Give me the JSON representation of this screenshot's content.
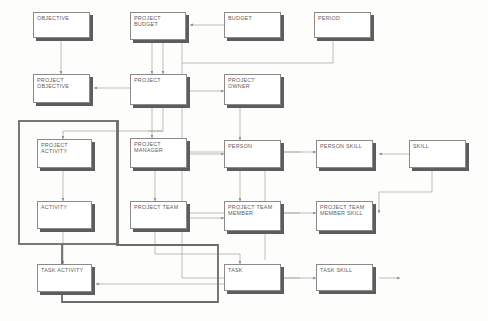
{
  "diagram": {
    "type": "entity-relationship-diagram",
    "background_color": "#fdfdfb",
    "entity_fill": "#ffffff",
    "entity_border": "#8a8a8a",
    "entity_shadow": "#5d5d5d",
    "label_color": "#5e5e5e",
    "connector_color": "#9a9a9a",
    "group_border_color": "#6b6b6b"
  },
  "entities": [
    {
      "id": "objective",
      "label": "OBJECTIVE",
      "x": 33,
      "y": 12,
      "w": 57,
      "h": 26
    },
    {
      "id": "project-budget",
      "label": "PROJECT\nBUDGET",
      "x": 130,
      "y": 12,
      "w": 56,
      "h": 28
    },
    {
      "id": "budget",
      "label": "BUDGET",
      "x": 224,
      "y": 12,
      "w": 57,
      "h": 26
    },
    {
      "id": "period",
      "label": "PERIOD",
      "x": 314,
      "y": 12,
      "w": 57,
      "h": 26
    },
    {
      "id": "project-objective",
      "label": "PROJECT\nOBJECTIVE",
      "x": 33,
      "y": 74,
      "w": 57,
      "h": 29
    },
    {
      "id": "project",
      "label": "PROJECT",
      "x": 130,
      "y": 74,
      "w": 57,
      "h": 31
    },
    {
      "id": "project-owner",
      "label": "PROJECT\nOWNER",
      "x": 224,
      "y": 74,
      "w": 57,
      "h": 31
    },
    {
      "id": "project-activity",
      "label": "PROJECT\nACTIVITY",
      "x": 37,
      "y": 139,
      "w": 55,
      "h": 29
    },
    {
      "id": "project-manager",
      "label": "PROJECT\nMANAGER",
      "x": 130,
      "y": 138,
      "w": 57,
      "h": 30
    },
    {
      "id": "person",
      "label": "PERSON",
      "x": 224,
      "y": 140,
      "w": 57,
      "h": 28
    },
    {
      "id": "person-skill",
      "label": "PERSON SKILL",
      "x": 316,
      "y": 140,
      "w": 57,
      "h": 28
    },
    {
      "id": "skill",
      "label": "SKILL",
      "x": 409,
      "y": 140,
      "w": 57,
      "h": 28
    },
    {
      "id": "activity",
      "label": "ACTIVITY",
      "x": 37,
      "y": 201,
      "w": 55,
      "h": 28
    },
    {
      "id": "project-team",
      "label": "PROJECT TEAM",
      "x": 130,
      "y": 201,
      "w": 57,
      "h": 28
    },
    {
      "id": "project-team-member",
      "label": "PROJECT TEAM\nMEMBER",
      "x": 224,
      "y": 201,
      "w": 57,
      "h": 30
    },
    {
      "id": "project-team-member-skill",
      "label": "PROJECT TEAM\nMEMBER SKILL",
      "x": 316,
      "y": 201,
      "w": 57,
      "h": 30
    },
    {
      "id": "task-activity",
      "label": "TASK ACTIVITY",
      "x": 37,
      "y": 264,
      "w": 55,
      "h": 28
    },
    {
      "id": "task",
      "label": "TASK",
      "x": 224,
      "y": 264,
      "w": 57,
      "h": 27
    },
    {
      "id": "task-skill",
      "label": "TASK SKILL",
      "x": 316,
      "y": 264,
      "w": 57,
      "h": 27
    }
  ],
  "groups": [
    {
      "id": "activity-group",
      "label": "",
      "points": "19,121 118,121 118,244 19,244"
    },
    {
      "id": "team-task-group",
      "label": "",
      "points": "117,121 117,245 218,245 218,302 62,302 62,121"
    }
  ],
  "connectors": [
    {
      "id": "objective-to-project-objective",
      "from": "objective",
      "to": "project-objective"
    },
    {
      "id": "project-budget-to-project",
      "from": "project-budget",
      "to": "project"
    },
    {
      "id": "budget-to-project-budget",
      "from": "budget",
      "to": "project-budget"
    },
    {
      "id": "period-to-project-budget",
      "from": "period",
      "to": "project-budget"
    },
    {
      "id": "period-to-person-skill",
      "from": "period",
      "to": "person-skill"
    },
    {
      "id": "project-to-project-objective",
      "from": "project",
      "to": "project-objective"
    },
    {
      "id": "project-to-project-owner",
      "from": "project",
      "to": "project-owner"
    },
    {
      "id": "project-to-project-manager",
      "from": "project",
      "to": "project-manager"
    },
    {
      "id": "project-to-project-activity",
      "from": "project",
      "to": "project-activity"
    },
    {
      "id": "project-owner-to-person",
      "from": "project-owner",
      "to": "person"
    },
    {
      "id": "project-manager-to-person",
      "from": "project-manager",
      "to": "person"
    },
    {
      "id": "project-manager-to-project-team",
      "from": "project-manager",
      "to": "project-team"
    },
    {
      "id": "person-to-person-skill",
      "from": "person",
      "to": "person-skill"
    },
    {
      "id": "skill-to-person-skill",
      "from": "skill",
      "to": "person-skill"
    },
    {
      "id": "skill-to-project-team-member-skill",
      "from": "skill",
      "to": "project-team-member-skill"
    },
    {
      "id": "skill-to-task-skill",
      "from": "skill",
      "to": "task-skill"
    },
    {
      "id": "project-activity-to-activity",
      "from": "project-activity",
      "to": "activity"
    },
    {
      "id": "activity-to-task-activity",
      "from": "activity",
      "to": "task-activity"
    },
    {
      "id": "project-team-to-project-team-member",
      "from": "project-team",
      "to": "project-team-member"
    },
    {
      "id": "project-team-to-task-activity",
      "from": "project-team",
      "to": "task-activity"
    },
    {
      "id": "person-to-project-team-member",
      "from": "person",
      "to": "project-team-member"
    },
    {
      "id": "project-team-member-to-pts-skill",
      "from": "project-team-member",
      "to": "project-team-member-skill"
    },
    {
      "id": "person-to-task",
      "from": "person",
      "to": "task"
    },
    {
      "id": "task-to-task-skill",
      "from": "task",
      "to": "task-skill"
    },
    {
      "id": "task-to-task-activity",
      "from": "task",
      "to": "task-activity"
    }
  ]
}
